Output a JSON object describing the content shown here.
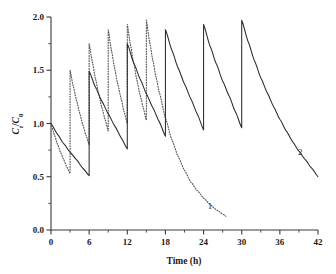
{
  "chart_data": {
    "type": "line",
    "title": "",
    "xlabel": "Time (h)",
    "ylabel": "Ct/C0",
    "ylabel_parts": {
      "c1": "C",
      "sub1": "t",
      "slash": "/",
      "c2": "C",
      "sub2": "0"
    },
    "xlim": [
      0,
      42
    ],
    "ylim": [
      0,
      2.0
    ],
    "xticks": [
      0,
      6,
      12,
      18,
      24,
      30,
      36,
      42
    ],
    "xtick_labels": [
      "0",
      "6",
      "12",
      "18",
      "24",
      "30",
      "36",
      "42"
    ],
    "xminor_step": 3,
    "yticks": [
      0.0,
      0.5,
      1.0,
      1.5,
      2.0
    ],
    "ytick_labels": [
      "0.0",
      "0.5",
      "1.0",
      "1.5",
      "2.0"
    ],
    "yminor_step": 0.25,
    "grid": false,
    "legend": "inline-curve-labels",
    "series": [
      {
        "name": "1",
        "label": "1",
        "style": "dotted",
        "color": "#555555",
        "dose_interval_h": 3,
        "last_dose_h": 15,
        "end_h": 27.5,
        "annotation": {
          "text": "1",
          "x": 25.0,
          "y": 0.2
        },
        "points": [
          [
            0,
            1.0
          ],
          [
            0.5,
            0.9
          ],
          [
            1.0,
            0.81
          ],
          [
            1.5,
            0.73
          ],
          [
            2.0,
            0.66
          ],
          [
            2.5,
            0.59
          ],
          [
            3.0,
            0.53
          ],
          [
            3.0,
            1.5
          ],
          [
            3.5,
            1.35
          ],
          [
            4.0,
            1.22
          ],
          [
            4.5,
            1.1
          ],
          [
            5.0,
            0.99
          ],
          [
            5.5,
            0.89
          ],
          [
            6.0,
            0.8
          ],
          [
            6.0,
            1.75
          ],
          [
            6.5,
            1.58
          ],
          [
            7.0,
            1.42
          ],
          [
            7.5,
            1.28
          ],
          [
            8.0,
            1.15
          ],
          [
            8.5,
            1.04
          ],
          [
            9.0,
            0.93
          ],
          [
            9.0,
            1.88
          ],
          [
            9.5,
            1.69
          ],
          [
            10.0,
            1.52
          ],
          [
            10.5,
            1.37
          ],
          [
            11.0,
            1.24
          ],
          [
            11.5,
            1.11
          ],
          [
            12.0,
            1.0
          ],
          [
            12.0,
            1.93
          ],
          [
            12.5,
            1.74
          ],
          [
            13.0,
            1.57
          ],
          [
            13.5,
            1.41
          ],
          [
            14.0,
            1.27
          ],
          [
            14.5,
            1.15
          ],
          [
            15.0,
            1.03
          ],
          [
            15.0,
            1.97
          ],
          [
            15.5,
            1.77
          ],
          [
            16.0,
            1.6
          ],
          [
            16.5,
            1.44
          ],
          [
            17.0,
            1.3
          ],
          [
            18.0,
            1.05
          ],
          [
            19.0,
            0.85
          ],
          [
            20.0,
            0.69
          ],
          [
            21.0,
            0.56
          ],
          [
            22.0,
            0.45
          ],
          [
            23.0,
            0.37
          ],
          [
            24.0,
            0.3
          ],
          [
            25.0,
            0.24
          ],
          [
            26.0,
            0.19
          ],
          [
            27.0,
            0.15
          ],
          [
            27.5,
            0.13
          ]
        ]
      },
      {
        "name": "2",
        "label": "2",
        "style": "solid",
        "color": "#2b2b2b",
        "dose_interval_h": 6,
        "last_dose_h": 30,
        "end_h": 42,
        "annotation": {
          "text": "2",
          "x": 39.2,
          "y": 0.7
        },
        "points": [
          [
            0,
            1.0
          ],
          [
            1,
            0.9
          ],
          [
            2,
            0.81
          ],
          [
            3,
            0.73
          ],
          [
            4,
            0.66
          ],
          [
            5,
            0.58
          ],
          [
            6,
            0.51
          ],
          [
            6,
            1.49
          ],
          [
            7,
            1.34
          ],
          [
            8,
            1.21
          ],
          [
            9,
            1.09
          ],
          [
            10,
            0.98
          ],
          [
            11,
            0.87
          ],
          [
            12,
            0.76
          ],
          [
            12,
            1.75
          ],
          [
            13,
            1.57
          ],
          [
            14,
            1.42
          ],
          [
            15,
            1.28
          ],
          [
            16,
            1.15
          ],
          [
            17,
            1.02
          ],
          [
            18,
            0.88
          ],
          [
            18,
            1.88
          ],
          [
            19,
            1.69
          ],
          [
            20,
            1.52
          ],
          [
            21,
            1.37
          ],
          [
            22,
            1.23
          ],
          [
            23,
            1.09
          ],
          [
            24,
            0.94
          ],
          [
            24,
            1.93
          ],
          [
            25,
            1.73
          ],
          [
            26,
            1.56
          ],
          [
            27,
            1.4
          ],
          [
            28,
            1.26
          ],
          [
            29,
            1.11
          ],
          [
            30,
            0.96
          ],
          [
            30,
            1.97
          ],
          [
            31,
            1.77
          ],
          [
            32,
            1.59
          ],
          [
            33,
            1.43
          ],
          [
            34,
            1.29
          ],
          [
            35,
            1.16
          ],
          [
            36,
            1.04
          ],
          [
            37,
            0.93
          ],
          [
            38,
            0.83
          ],
          [
            39,
            0.74
          ],
          [
            40,
            0.66
          ],
          [
            41,
            0.58
          ],
          [
            42,
            0.5
          ]
        ]
      }
    ]
  },
  "axes": {
    "x_title": "Time (h)",
    "y_title": "Ct/C0"
  }
}
